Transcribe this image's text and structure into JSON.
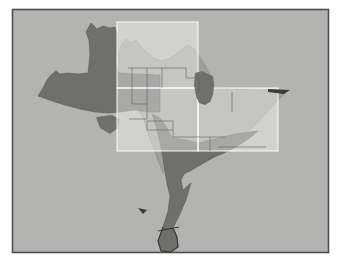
{
  "figure": {
    "kind": "map overlay figure",
    "visible_text": ""
  },
  "colors": {
    "page_bg": "#ffffff",
    "map_bg": "#b3b3b1",
    "frame_border": "#4e4e4c",
    "dark_layer": "#6f6f6d",
    "dark_layer_outline": "#45454388",
    "light_layer": "#9e9e9c",
    "light_layer_outline": "#7d7d7b99",
    "county_line": "#5f5f5d",
    "strip_outline": "#2b2b29",
    "quad_fill": "rgba(255,255,255,0.40)",
    "quad_border": "rgba(255,255,255,0.82)",
    "tip_sliver": "#3c3c3a"
  }
}
